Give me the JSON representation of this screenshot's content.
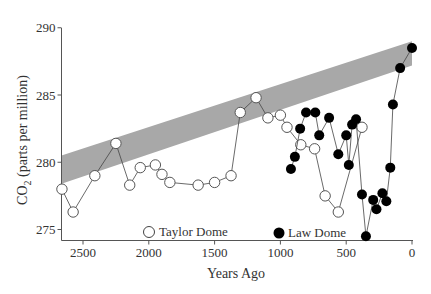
{
  "chart_data": {
    "type": "scatter",
    "title": "",
    "xlabel": "Years Ago",
    "ylabel": "CO2 (parts per million)",
    "ylabel_main": "CO",
    "ylabel_sub": "2",
    "ylabel_rest": " (parts per million)",
    "xlim": [
      2680,
      0
    ],
    "ylim": [
      274.2,
      290.8
    ],
    "x_reversed": true,
    "xticks": [
      2500,
      2000,
      1500,
      1000,
      500,
      0
    ],
    "yticks": [
      275,
      280,
      285,
      290
    ],
    "grid": false,
    "legend_position": "bottom-inside",
    "band": {
      "description": "shaded gray trend band",
      "color": "#a8a8a8",
      "left": {
        "x": 2670,
        "y_low": 278.4,
        "y_high": 280.5
      },
      "right": {
        "x": 0,
        "y_low": 287.2,
        "y_high": 289.0
      }
    },
    "series": [
      {
        "name": "Taylor Dome",
        "marker": "open-circle",
        "points": [
          [
            2660,
            278.0
          ],
          [
            2575,
            276.3
          ],
          [
            2410,
            279.0
          ],
          [
            2250,
            281.4
          ],
          [
            2145,
            278.3
          ],
          [
            2065,
            279.6
          ],
          [
            1950,
            279.8
          ],
          [
            1900,
            279.1
          ],
          [
            1840,
            278.5
          ],
          [
            1625,
            278.3
          ],
          [
            1500,
            278.5
          ],
          [
            1375,
            279.0
          ],
          [
            1305,
            283.7
          ],
          [
            1185,
            284.8
          ],
          [
            1095,
            283.3
          ],
          [
            1000,
            283.5
          ],
          [
            950,
            282.6
          ],
          [
            845,
            281.3
          ],
          [
            740,
            281.0
          ],
          [
            660,
            277.5
          ],
          [
            560,
            276.3
          ],
          [
            380,
            282.6
          ]
        ]
      },
      {
        "name": "Law Dome",
        "marker": "filled-circle",
        "points": [
          [
            920,
            279.5
          ],
          [
            890,
            280.4
          ],
          [
            850,
            282.5
          ],
          [
            805,
            283.7
          ],
          [
            735,
            283.7
          ],
          [
            705,
            282.0
          ],
          [
            630,
            283.3
          ],
          [
            560,
            280.6
          ],
          [
            500,
            282.0
          ],
          [
            480,
            279.8
          ],
          [
            455,
            282.8
          ],
          [
            425,
            283.2
          ],
          [
            380,
            277.6
          ],
          [
            350,
            274.5
          ],
          [
            295,
            277.2
          ],
          [
            270,
            276.5
          ],
          [
            225,
            277.7
          ],
          [
            195,
            277.1
          ],
          [
            165,
            279.6
          ],
          [
            145,
            284.3
          ],
          [
            90,
            287.0
          ],
          [
            0,
            288.5
          ]
        ]
      }
    ]
  },
  "legend": {
    "taylor_label": "Taylor Dome",
    "law_label": "Law Dome"
  },
  "colors": {
    "band": "#a8a8a8",
    "axis": "#555555",
    "line": "#444444",
    "marker_fill_open": "#ffffff",
    "marker_fill_filled": "#000000"
  }
}
